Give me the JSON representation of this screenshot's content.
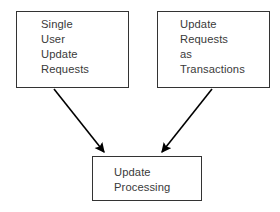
{
  "diagram": {
    "type": "flow-diagram",
    "background_color": "#ffffff",
    "node_border_color": "#333333",
    "text_color": "#3a3a3a",
    "arrow_color": "#000000",
    "nodes": [
      {
        "id": "single-user-update-requests",
        "label": "Single\nUser\nUpdate\nRequests",
        "lines": [
          "Single",
          "User",
          "Update",
          "Requests"
        ],
        "x": 16,
        "y": 11,
        "width": 113,
        "height": 77
      },
      {
        "id": "update-requests-as-transactions",
        "label": "Update\nRequests\nas\nTransactions",
        "lines": [
          "Update",
          "Requests",
          "as",
          "Transactions"
        ],
        "x": 157,
        "y": 11,
        "width": 113,
        "height": 77
      },
      {
        "id": "update-processing",
        "label": "Update\nProcessing",
        "lines": [
          "Update",
          "Processing"
        ],
        "x": 92,
        "y": 156,
        "width": 110,
        "height": 45
      }
    ],
    "edges": [
      {
        "id": "edge-single-user-to-update-processing",
        "from": "single-user-update-requests",
        "to": "update-processing",
        "arrowhead": "filled-triangle",
        "x1": 54,
        "y1": 89,
        "x2": 106,
        "y2": 155
      },
      {
        "id": "edge-transactions-to-update-processing",
        "from": "update-requests-as-transactions",
        "to": "update-processing",
        "arrowhead": "filled-triangle",
        "x1": 212,
        "y1": 89,
        "x2": 160,
        "y2": 155
      }
    ]
  }
}
